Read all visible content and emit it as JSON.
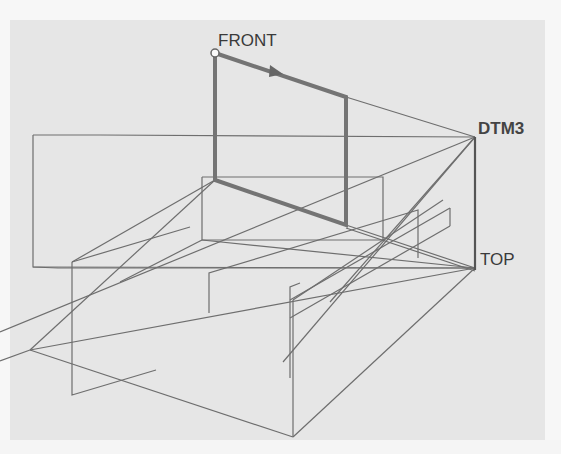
{
  "figure": {
    "type": "datum-planes-3d-wireframe",
    "colors": {
      "background": "#e6e6e6",
      "page": "#f7f7f7",
      "thin_line": "#6e6e6e",
      "thick_line": "#707070",
      "label": "#3a3a3a"
    }
  },
  "labels": {
    "front": "FRONT",
    "dtm3": "DTM3",
    "top": "TOP"
  },
  "points": {
    "front_origin": [
      215,
      53
    ],
    "dtm3_vertex": [
      475,
      137
    ],
    "top_vertex": [
      475,
      268
    ]
  }
}
